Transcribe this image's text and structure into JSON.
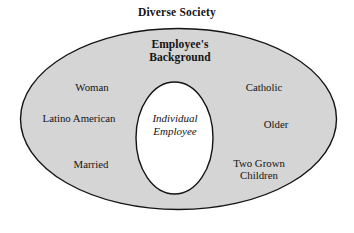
{
  "diagram": {
    "type": "nested-ellipse-venn",
    "title": "Diverse Society",
    "outer_region_label": "Employee's\nBackground",
    "inner_region_label": "Individual\nEmployee",
    "colors": {
      "page_background": "#ffffff",
      "outer_ellipse_fill": "#d5d5d5",
      "outer_ellipse_stroke": "#141414",
      "inner_ellipse_fill": "#ffffff",
      "inner_ellipse_stroke": "#141414",
      "text": "#141414"
    },
    "left_attributes": [
      {
        "label": "Woman"
      },
      {
        "label": "Latino American"
      },
      {
        "label": "Married"
      }
    ],
    "right_attributes": [
      {
        "label": "Catholic"
      },
      {
        "label": "Older"
      },
      {
        "label": "Two Grown\nChildren"
      }
    ]
  }
}
